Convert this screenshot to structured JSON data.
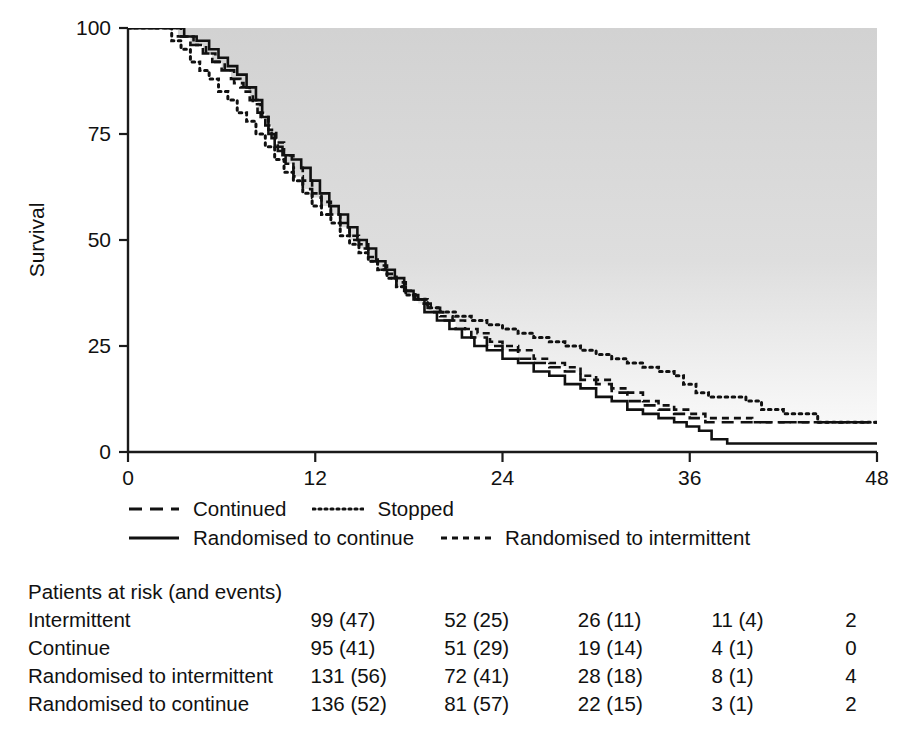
{
  "chart_data": {
    "type": "line",
    "title": "",
    "xlabel": "",
    "ylabel": "Survival",
    "xlim": [
      0,
      48
    ],
    "ylim": [
      0,
      100
    ],
    "xticks": [
      0,
      12,
      24,
      36,
      48
    ],
    "yticks": [
      0,
      25,
      50,
      75,
      100
    ],
    "xticklabels": [
      "0",
      "12",
      "24",
      "36",
      "48"
    ],
    "yticklabels": [
      "0",
      "25",
      "50",
      "75",
      "100"
    ],
    "grid": false,
    "legend_position": "below-axes",
    "background_note": "grey shaded region above the curves fading to white",
    "series": [
      {
        "name": "Continued",
        "style": "long-dashed",
        "points": [
          [
            0,
            100
          ],
          [
            2.6,
            100
          ],
          [
            3.2,
            98
          ],
          [
            4.0,
            96
          ],
          [
            4.8,
            94
          ],
          [
            5.4,
            92
          ],
          [
            6.0,
            90
          ],
          [
            6.6,
            88
          ],
          [
            7.2,
            86
          ],
          [
            7.8,
            83
          ],
          [
            8.3,
            80
          ],
          [
            8.8,
            77
          ],
          [
            9.2,
            74
          ],
          [
            9.6,
            71
          ],
          [
            10.1,
            68
          ],
          [
            10.6,
            65
          ],
          [
            11.2,
            62
          ],
          [
            11.8,
            60
          ],
          [
            12.4,
            58
          ],
          [
            13.0,
            56
          ],
          [
            13.6,
            53
          ],
          [
            14.2,
            50
          ],
          [
            14.8,
            48
          ],
          [
            15.4,
            45
          ],
          [
            16.0,
            43
          ],
          [
            16.6,
            41
          ],
          [
            17.2,
            39
          ],
          [
            17.8,
            37
          ],
          [
            18.6,
            35
          ],
          [
            19.4,
            33
          ],
          [
            20.2,
            31
          ],
          [
            21.0,
            29
          ],
          [
            22.0,
            27
          ],
          [
            23.0,
            25
          ],
          [
            24.0,
            24
          ],
          [
            25.0,
            22
          ],
          [
            26.0,
            21
          ],
          [
            27.0,
            20
          ],
          [
            28.0,
            19
          ],
          [
            29.0,
            17
          ],
          [
            30.0,
            16
          ],
          [
            31.0,
            14
          ],
          [
            32.0,
            12
          ],
          [
            33.0,
            11
          ],
          [
            34.0,
            10
          ],
          [
            35.0,
            9
          ],
          [
            36.0,
            8
          ],
          [
            37.0,
            7
          ],
          [
            38.0,
            7
          ],
          [
            40.0,
            7
          ],
          [
            42.0,
            7
          ],
          [
            44.0,
            7
          ],
          [
            46.0,
            7
          ],
          [
            48.0,
            7
          ]
        ]
      },
      {
        "name": "Stopped",
        "style": "dotted",
        "points": [
          [
            0,
            100
          ],
          [
            2.2,
            100
          ],
          [
            2.8,
            97
          ],
          [
            3.4,
            95
          ],
          [
            4.0,
            92
          ],
          [
            4.6,
            90
          ],
          [
            5.2,
            88
          ],
          [
            5.8,
            85
          ],
          [
            6.4,
            83
          ],
          [
            7.0,
            80
          ],
          [
            7.6,
            78
          ],
          [
            8.2,
            75
          ],
          [
            8.8,
            72
          ],
          [
            9.4,
            69
          ],
          [
            10.0,
            66
          ],
          [
            10.6,
            64
          ],
          [
            11.2,
            61
          ],
          [
            11.8,
            58
          ],
          [
            12.4,
            56
          ],
          [
            13.0,
            54
          ],
          [
            13.6,
            51
          ],
          [
            14.2,
            49
          ],
          [
            14.8,
            47
          ],
          [
            15.4,
            45
          ],
          [
            16.0,
            43
          ],
          [
            16.6,
            41
          ],
          [
            17.2,
            39
          ],
          [
            17.8,
            37
          ],
          [
            18.4,
            36
          ],
          [
            19.2,
            34
          ],
          [
            20.0,
            33
          ],
          [
            21.0,
            32
          ],
          [
            22.0,
            31
          ],
          [
            23.0,
            30
          ],
          [
            24.0,
            29
          ],
          [
            25.0,
            28
          ],
          [
            26.0,
            27
          ],
          [
            27.0,
            26
          ],
          [
            28.0,
            25
          ],
          [
            29.0,
            24
          ],
          [
            30.0,
            23
          ],
          [
            31.0,
            22
          ],
          [
            32.0,
            21
          ],
          [
            33.0,
            20
          ],
          [
            34.0,
            19
          ],
          [
            35.0,
            18
          ],
          [
            35.6,
            16
          ],
          [
            36.4,
            14
          ],
          [
            37.2,
            13
          ],
          [
            38.4,
            13
          ],
          [
            39.6,
            12
          ],
          [
            40.6,
            10
          ],
          [
            42.0,
            9
          ],
          [
            43.4,
            9
          ],
          [
            44.2,
            7
          ],
          [
            46.0,
            7
          ],
          [
            48.0,
            7
          ]
        ]
      },
      {
        "name": "Randomised to continue",
        "style": "solid",
        "points": [
          [
            0,
            100
          ],
          [
            2.9,
            100
          ],
          [
            3.6,
            98
          ],
          [
            4.4,
            97
          ],
          [
            5.2,
            95
          ],
          [
            5.8,
            93
          ],
          [
            6.4,
            91
          ],
          [
            7.0,
            89
          ],
          [
            7.6,
            86
          ],
          [
            8.2,
            83
          ],
          [
            8.6,
            79
          ],
          [
            9.0,
            75
          ],
          [
            9.4,
            72
          ],
          [
            9.9,
            70
          ],
          [
            10.5,
            69
          ],
          [
            11.1,
            67
          ],
          [
            11.7,
            64
          ],
          [
            12.3,
            61
          ],
          [
            12.9,
            58
          ],
          [
            13.5,
            56
          ],
          [
            14.1,
            53
          ],
          [
            14.7,
            50
          ],
          [
            15.3,
            48
          ],
          [
            15.9,
            45
          ],
          [
            16.5,
            43
          ],
          [
            17.1,
            41
          ],
          [
            17.7,
            38
          ],
          [
            18.3,
            36
          ],
          [
            19.0,
            33
          ],
          [
            19.8,
            31
          ],
          [
            20.6,
            29
          ],
          [
            21.4,
            27
          ],
          [
            22.2,
            25
          ],
          [
            23.0,
            24
          ],
          [
            24.0,
            22
          ],
          [
            25.0,
            21
          ],
          [
            26.0,
            19
          ],
          [
            27.0,
            18
          ],
          [
            28.0,
            16
          ],
          [
            29.0,
            15
          ],
          [
            30.0,
            13
          ],
          [
            31.0,
            12
          ],
          [
            32.0,
            10
          ],
          [
            33.0,
            9
          ],
          [
            34.0,
            8
          ],
          [
            35.0,
            7
          ],
          [
            35.8,
            6
          ],
          [
            36.6,
            5
          ],
          [
            37.4,
            3
          ],
          [
            38.4,
            2
          ],
          [
            40.0,
            2
          ],
          [
            43.0,
            2
          ],
          [
            46.0,
            2
          ],
          [
            48.0,
            2
          ]
        ]
      },
      {
        "name": "Randomised to intermittent",
        "style": "short-dashed",
        "points": [
          [
            0,
            100
          ],
          [
            2.7,
            100
          ],
          [
            3.4,
            98
          ],
          [
            4.2,
            96
          ],
          [
            5.0,
            94
          ],
          [
            5.6,
            92
          ],
          [
            6.2,
            90
          ],
          [
            6.8,
            87
          ],
          [
            7.4,
            85
          ],
          [
            8.0,
            82
          ],
          [
            8.5,
            79
          ],
          [
            9.0,
            76
          ],
          [
            9.5,
            73
          ],
          [
            10.0,
            70
          ],
          [
            10.6,
            67
          ],
          [
            11.2,
            64
          ],
          [
            11.8,
            61
          ],
          [
            12.4,
            59
          ],
          [
            13.0,
            56
          ],
          [
            13.6,
            54
          ],
          [
            14.2,
            51
          ],
          [
            14.8,
            49
          ],
          [
            15.4,
            46
          ],
          [
            16.0,
            44
          ],
          [
            16.6,
            42
          ],
          [
            17.2,
            40
          ],
          [
            17.8,
            38
          ],
          [
            18.4,
            36
          ],
          [
            19.2,
            34
          ],
          [
            20.0,
            32
          ],
          [
            20.8,
            31
          ],
          [
            21.6,
            29
          ],
          [
            22.4,
            28
          ],
          [
            23.2,
            26
          ],
          [
            24.0,
            25
          ],
          [
            25.0,
            24
          ],
          [
            26.0,
            22
          ],
          [
            27.0,
            21
          ],
          [
            28.0,
            20
          ],
          [
            29.0,
            18
          ],
          [
            30.0,
            17
          ],
          [
            31.0,
            15
          ],
          [
            32.0,
            14
          ],
          [
            33.0,
            12
          ],
          [
            34.0,
            11
          ],
          [
            35.0,
            10
          ],
          [
            36.0,
            9
          ],
          [
            37.0,
            8
          ],
          [
            38.0,
            8
          ],
          [
            40.0,
            7
          ],
          [
            42.0,
            7
          ],
          [
            44.0,
            7
          ],
          [
            46.0,
            7
          ],
          [
            48.0,
            7
          ]
        ]
      }
    ]
  },
  "legend": {
    "row1": [
      {
        "label": "Continued",
        "style": "long-dashed"
      },
      {
        "label": "Stopped",
        "style": "dotted"
      }
    ],
    "row2": [
      {
        "label": "Randomised to continue",
        "style": "solid"
      },
      {
        "label": "Randomised to intermittent",
        "style": "short-dashed"
      }
    ]
  },
  "risk_table": {
    "title": "Patients at risk (and events)",
    "rows": [
      {
        "label": "Intermittent",
        "values": [
          "99 (47)",
          "52 (25)",
          "26 (11)",
          "11 (4)",
          "2"
        ]
      },
      {
        "label": "Continue",
        "values": [
          "95 (41)",
          "51 (29)",
          "19 (14)",
          "4 (1)",
          "0"
        ]
      },
      {
        "label": "Randomised to intermittent",
        "values": [
          "131 (56)",
          "72 (41)",
          "28 (18)",
          "8 (1)",
          "4"
        ]
      },
      {
        "label": "Randomised to continue",
        "values": [
          "136 (52)",
          "81 (57)",
          "22 (15)",
          "3 (1)",
          "2"
        ]
      }
    ]
  },
  "colors": {
    "ink": "#111111",
    "plot_shade": "#d4d4d4",
    "page": "#ffffff"
  }
}
